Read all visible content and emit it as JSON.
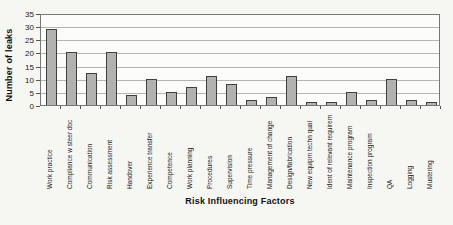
{
  "chart_data": {
    "type": "bar",
    "title": "",
    "xlabel": "Risk Influencing Factors",
    "ylabel": "Number of leaks",
    "ylim": [
      0,
      35
    ],
    "ytick_step": 5,
    "yticks": [
      0,
      5,
      10,
      15,
      20,
      25,
      30,
      35
    ],
    "grid": "horizontal",
    "legend": "none",
    "bar_fill_color": "#b2b2ae",
    "bar_border_color": "#3f3f3d",
    "categories": [
      "Work practice",
      "Compliance w steer doc",
      "Communication",
      "Risk assessment",
      "Handover",
      "Experience transfer",
      "Competence",
      "Work planning",
      "Procedures",
      "Supervision",
      "Time pressure",
      "Management of change",
      "Design/fabrication",
      "New equipm techn qual",
      "Ident of relevant requirem",
      "Maintenance program",
      "Inspection program",
      "QA",
      "Logging",
      "Mustering"
    ],
    "values": [
      29,
      20,
      12,
      20,
      4,
      10,
      5,
      7,
      11,
      8,
      2,
      3,
      11,
      1,
      1,
      5,
      2,
      10,
      2,
      1
    ]
  }
}
